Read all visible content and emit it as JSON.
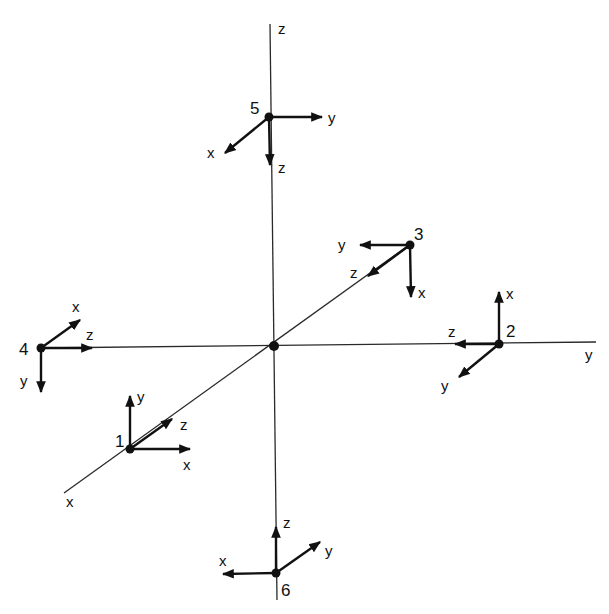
{
  "diagram": {
    "type": "3d-coordinate-frames",
    "global_axes": {
      "z": {
        "label": "z"
      },
      "y": {
        "label": "y"
      },
      "x": {
        "label": "x"
      }
    },
    "origin": {
      "label": ""
    },
    "frames": [
      {
        "id": "1",
        "label": "1",
        "arrows": [
          {
            "label": "y",
            "dir": "up"
          },
          {
            "label": "z",
            "dir": "up-right (along +x axis diagonal toward origin)"
          },
          {
            "label": "x",
            "dir": "right"
          }
        ]
      },
      {
        "id": "2",
        "label": "2",
        "arrows": [
          {
            "label": "x",
            "dir": "up"
          },
          {
            "label": "z",
            "dir": "left"
          },
          {
            "label": "y",
            "dir": "down-left"
          }
        ]
      },
      {
        "id": "3",
        "label": "3",
        "arrows": [
          {
            "label": "y",
            "dir": "left"
          },
          {
            "label": "z",
            "dir": "down-left"
          },
          {
            "label": "x",
            "dir": "down"
          }
        ]
      },
      {
        "id": "4",
        "label": "4",
        "arrows": [
          {
            "label": "x",
            "dir": "up-right"
          },
          {
            "label": "z",
            "dir": "right"
          },
          {
            "label": "y",
            "dir": "down"
          }
        ]
      },
      {
        "id": "5",
        "label": "5",
        "arrows": [
          {
            "label": "y",
            "dir": "right"
          },
          {
            "label": "x",
            "dir": "down-left"
          },
          {
            "label": "z",
            "dir": "down"
          }
        ]
      },
      {
        "id": "6",
        "label": "6",
        "arrows": [
          {
            "label": "z",
            "dir": "up"
          },
          {
            "label": "y",
            "dir": "up-right"
          },
          {
            "label": "x",
            "dir": "left"
          }
        ]
      }
    ]
  }
}
